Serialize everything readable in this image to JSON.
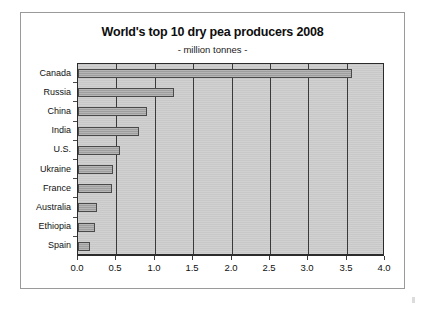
{
  "chart_data": {
    "type": "bar",
    "orientation": "horizontal",
    "title": "World's top 10 dry pea producers 2008",
    "subtitle": "- million tonnes -",
    "xlabel": "",
    "ylabel": "",
    "xlim": [
      0.0,
      4.0
    ],
    "xtick_step": 0.5,
    "xticks": [
      "0.0",
      "0.5",
      "1.0",
      "1.5",
      "2.0",
      "2.5",
      "3.0",
      "3.5",
      "4.0"
    ],
    "grid": "vertical",
    "legend": "none",
    "units": "million tonnes",
    "categories": [
      "Canada",
      "Russia",
      "China",
      "India",
      "U.S.",
      "Ukraine",
      "France",
      "Australia",
      "Ethiopia",
      "Spain"
    ],
    "values": [
      3.57,
      1.25,
      0.9,
      0.8,
      0.55,
      0.46,
      0.44,
      0.25,
      0.22,
      0.15
    ],
    "colors": {
      "bar_fill": "#a4a4a4",
      "bar_outline": "#4a4a4a",
      "plot_background": "#c8c8c8",
      "axis": "#2b2b2b",
      "gridline": "#3a3a3a",
      "text": "#111111",
      "page_background": "#ffffff",
      "frame_border": "#9a9a9a"
    }
  }
}
